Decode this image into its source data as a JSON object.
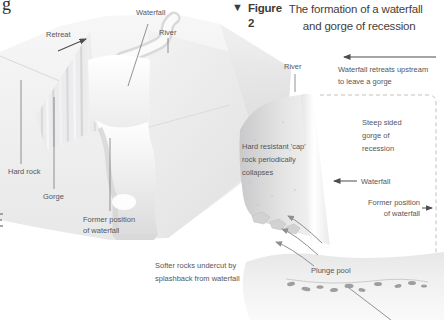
{
  "page": {
    "clipped_letter": "g"
  },
  "figure_header": {
    "marker": "▼",
    "label": "Figure 2",
    "title_line1": "The formation of a waterfall",
    "title_line2": "and gorge of recession"
  },
  "block_diagram": {
    "labels": {
      "retreat": "Retreat",
      "waterfall": "Waterfall",
      "river": "River",
      "hard_rock": "Hard rock",
      "gorge": "Gorge",
      "former_position_line1": "Former position",
      "former_position_line2": "of waterfall"
    }
  },
  "cross_section": {
    "labels": {
      "river": "River",
      "retreat_note_line1": "Waterfall retreats upstream",
      "retreat_note_line2": "to leave a gorge",
      "steep_sided_line1": "Steep sided",
      "steep_sided_line2": "gorge of",
      "steep_sided_line3": "recession",
      "cap_rock_line1": "Hard resistant 'cap'",
      "cap_rock_line2": "rock periodically",
      "cap_rock_line3": "collapses",
      "waterfall": "Waterfall",
      "former_position_line1": "Former position",
      "former_position_line2": "of waterfall",
      "softer_rocks_line1": "Softer rocks undercut by",
      "softer_rocks_line2": "splashback from waterfall",
      "plunge_pool": "Plunge pool"
    }
  },
  "colors": {
    "label_text": "#56565a",
    "title_text": "#3e3a36",
    "dashed_line": "#c7c1b7",
    "arrow": "#4d4d4d",
    "leader_line": "#77777a"
  }
}
